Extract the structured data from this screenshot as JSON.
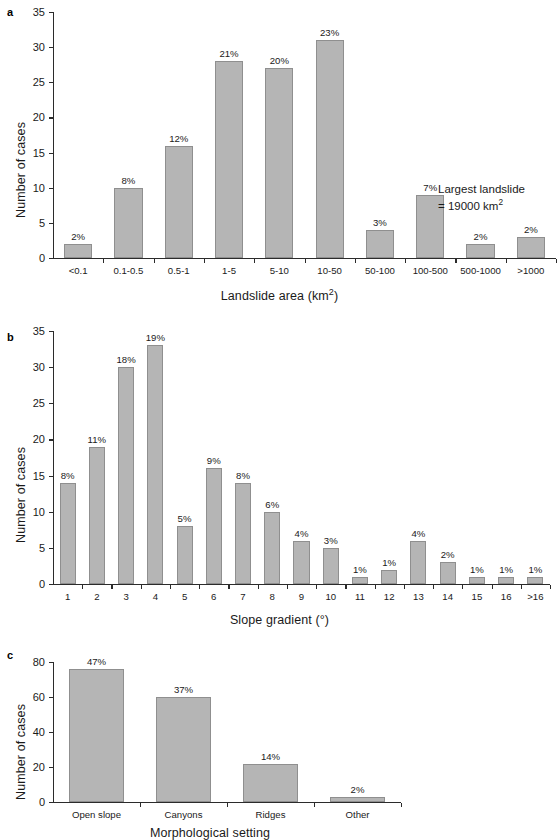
{
  "figure": {
    "panel_letters": {
      "a": "a",
      "b": "b",
      "c": "c"
    },
    "y_axis_title": "Number of cases"
  },
  "chart_data": [
    {
      "panel": "a",
      "type": "bar",
      "title": "",
      "xlabel": "Landslide area (km2)",
      "xlabel_base": "Landslide area (km",
      "xlabel_sup": "2",
      "xlabel_tail": ")",
      "ylabel": "Number of cases",
      "ylim": [
        0,
        35
      ],
      "yticks": [
        0,
        5,
        10,
        15,
        20,
        25,
        30,
        35
      ],
      "grid": false,
      "legend": "none",
      "categories": [
        "<0.1",
        "0.1-0.5",
        "0.5-1",
        "1-5",
        "5-10",
        "10-50",
        "50-100",
        "100-500",
        "500-1000",
        ">1000"
      ],
      "values": [
        2,
        10,
        16,
        28,
        27,
        31,
        4,
        9,
        2,
        3
      ],
      "data_labels": [
        "2%",
        "8%",
        "12%",
        "21%",
        "20%",
        "23%",
        "3%",
        "7%",
        "2%",
        "2%"
      ],
      "annotation_line1": "Largest landslide",
      "annotation_line2_base": "= 19000 km",
      "annotation_line2_sup": "2"
    },
    {
      "panel": "b",
      "type": "bar",
      "title": "",
      "xlabel": "Slope gradient (°)",
      "ylabel": "Number of cases",
      "ylim": [
        0,
        35
      ],
      "yticks": [
        0,
        5,
        10,
        15,
        20,
        25,
        30,
        35
      ],
      "grid": false,
      "legend": "none",
      "categories": [
        "1",
        "2",
        "3",
        "4",
        "5",
        "6",
        "7",
        "8",
        "9",
        "10",
        "11",
        "12",
        "13",
        "14",
        "15",
        "16",
        ">16"
      ],
      "values": [
        14,
        19,
        30,
        33,
        8,
        16,
        14,
        10,
        6,
        5,
        1,
        2,
        6,
        3,
        1,
        1,
        1
      ],
      "data_labels": [
        "8%",
        "11%",
        "18%",
        "19%",
        "5%",
        "9%",
        "8%",
        "6%",
        "4%",
        "3%",
        "1%",
        "1%",
        "4%",
        "2%",
        "1%",
        "1%",
        "1%"
      ]
    },
    {
      "panel": "c",
      "type": "bar",
      "title": "",
      "xlabel": "Morphological setting",
      "ylabel": "Number of cases",
      "ylim": [
        0,
        80
      ],
      "yticks": [
        0,
        20,
        40,
        60,
        80
      ],
      "grid": false,
      "legend": "none",
      "categories": [
        "Open slope",
        "Canyons",
        "Ridges",
        "Other"
      ],
      "values": [
        76,
        60,
        22,
        3
      ],
      "data_labels": [
        "47%",
        "37%",
        "14%",
        "2%"
      ]
    }
  ],
  "colors": {
    "bar_fill": "#b5b5b5",
    "bar_stroke": "#8f8f8f",
    "axis": "#2b2b2b",
    "text": "#1a1a1a",
    "background": "#ffffff"
  }
}
